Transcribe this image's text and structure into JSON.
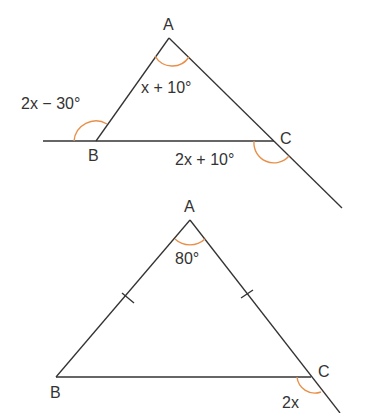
{
  "figure1": {
    "vertices": {
      "A": "A",
      "B": "B",
      "C": "C"
    },
    "angles": {
      "interior_A": "x + 10°",
      "exterior_B": "2x − 30°",
      "exterior_C": "2x + 10°"
    }
  },
  "figure2": {
    "vertices": {
      "A": "A",
      "B": "B",
      "C": "C"
    },
    "angles": {
      "interior_A": "80°",
      "exterior_C": "2x"
    },
    "equal_sides": [
      "AB",
      "AC"
    ]
  },
  "colors": {
    "line": "#333333",
    "arc": "#e8904a"
  }
}
